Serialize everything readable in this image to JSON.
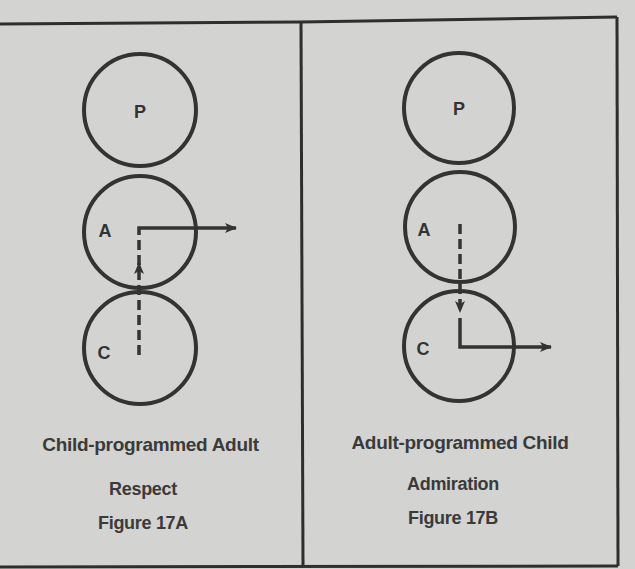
{
  "panels": [
    {
      "id": "17A",
      "circles": [
        {
          "label": "P",
          "name": "parent"
        },
        {
          "label": "A",
          "name": "adult"
        },
        {
          "label": "C",
          "name": "child"
        }
      ],
      "caption": "Child-programmed Adult",
      "subtitle": "Respect",
      "figure_label": "Figure 17A",
      "arrow_description": "Dashed arrow rises from Child into Adult, then a solid arrow exits Adult to the right"
    },
    {
      "id": "17B",
      "circles": [
        {
          "label": "P",
          "name": "parent"
        },
        {
          "label": "A",
          "name": "adult"
        },
        {
          "label": "C",
          "name": "child"
        }
      ],
      "caption": "Adult-programmed Child",
      "subtitle": "Admiration",
      "figure_label": "Figure 17B",
      "arrow_description": "Dashed arrow descends from Adult into Child, then a solid arrow exits Child to the right"
    }
  ],
  "colors": {
    "background": "#d3d3d1",
    "ink": "#333333"
  }
}
